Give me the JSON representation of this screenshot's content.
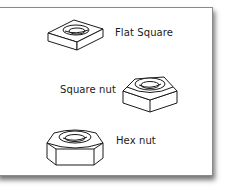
{
  "diagram": {
    "items": [
      {
        "label": "Flat Square",
        "icon": "flat-square-nut-icon"
      },
      {
        "label": "Square nut",
        "icon": "square-nut-icon"
      },
      {
        "label": "Hex nut",
        "icon": "hex-nut-icon"
      }
    ],
    "colors": {
      "line": "#1a1a1a",
      "background": "#ffffff",
      "border": "#8a8a8a"
    }
  }
}
